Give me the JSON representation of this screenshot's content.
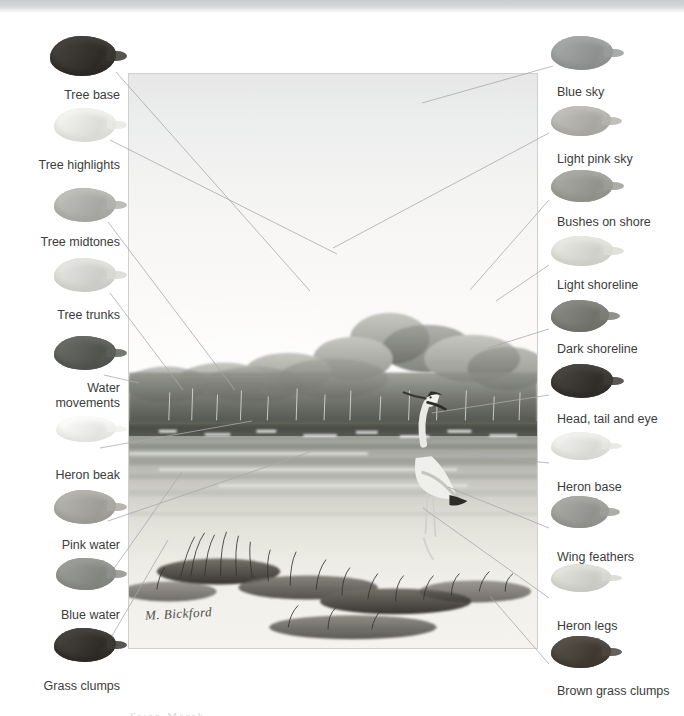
{
  "page": {
    "kind": "painting-color-key-plate",
    "background_color": "#ffffff",
    "top_bar_color": "#d0d2d4"
  },
  "plate": {
    "name": "heron-marsh-painting",
    "signature": "M. Bickford",
    "border_color": "#cfcfcf",
    "bottom_caption_fragment": "Swan Marsh"
  },
  "left_column": {
    "align": "right",
    "items": [
      {
        "label": "Tree base",
        "swatch_color": "#3a3733",
        "swatch_name": "swatch-tree-base"
      },
      {
        "label": "Tree highlights",
        "swatch_color": "#e7e7e4",
        "swatch_name": "swatch-tree-highlights"
      },
      {
        "label": "Tree midtones",
        "swatch_color": "#b2b3ae",
        "swatch_name": "swatch-tree-midtones"
      },
      {
        "label": "Tree trunks",
        "swatch_color": "#d8d9d4",
        "swatch_name": "swatch-tree-trunks"
      },
      {
        "label": "Water\nmovements",
        "swatch_color": "#5d5f5b",
        "swatch_name": "swatch-water-movements"
      },
      {
        "label": "Heron beak",
        "swatch_color": "#f0f0ee",
        "swatch_name": "swatch-heron-beak"
      },
      {
        "label": "Pink water",
        "swatch_color": "#a9a8a2",
        "swatch_name": "swatch-pink-water"
      },
      {
        "label": "Blue water",
        "swatch_color": "#8f918c",
        "swatch_name": "swatch-blue-water"
      },
      {
        "label": "Grass clumps",
        "swatch_color": "#3b3834",
        "swatch_name": "swatch-grass-clumps"
      }
    ]
  },
  "right_column": {
    "align": "left",
    "items": [
      {
        "label": "Blue sky",
        "swatch_color": "#9a9c9b",
        "swatch_name": "swatch-blue-sky"
      },
      {
        "label": "Light pink sky",
        "swatch_color": "#b4b3ae",
        "swatch_name": "swatch-light-pink-sky"
      },
      {
        "label": "Bushes on shore",
        "swatch_color": "#9d9e98",
        "swatch_name": "swatch-bushes-on-shore"
      },
      {
        "label": "Light shoreline",
        "swatch_color": "#dcdcd6",
        "swatch_name": "swatch-light-shoreline"
      },
      {
        "label": "Dark shoreline",
        "swatch_color": "#7d7e77",
        "swatch_name": "swatch-dark-shoreline"
      },
      {
        "label": "Head, tail and eye",
        "swatch_color": "#3d3a36",
        "swatch_name": "swatch-head-tail-eye"
      },
      {
        "label": "Heron base",
        "swatch_color": "#e5e5e1",
        "swatch_name": "swatch-heron-base"
      },
      {
        "label": "Wing feathers",
        "swatch_color": "#9d9e99",
        "swatch_name": "swatch-wing-feathers"
      },
      {
        "label": "Heron legs",
        "swatch_color": "#d7d7d1",
        "swatch_name": "swatch-heron-legs"
      },
      {
        "label": "Brown grass clumps",
        "swatch_color": "#4c453e",
        "swatch_name": "swatch-brown-grass-clumps"
      }
    ]
  },
  "leader_lines": {
    "color": "#a9a9a9",
    "left": [
      {
        "from": [
          116,
          72
        ],
        "to": [
          310,
          291
        ]
      },
      {
        "from": [
          110,
          140
        ],
        "to": [
          337,
          254
        ]
      },
      {
        "from": [
          108,
          222
        ],
        "to": [
          235,
          390
        ]
      },
      {
        "from": [
          110,
          293
        ],
        "to": [
          183,
          390
        ]
      },
      {
        "from": [
          104,
          375
        ],
        "to": [
          139,
          383
        ]
      },
      {
        "from": [
          100,
          448
        ],
        "to": [
          252,
          421
        ]
      },
      {
        "from": [
          108,
          521
        ],
        "to": [
          310,
          452
        ]
      },
      {
        "from": [
          108,
          577
        ],
        "to": [
          182,
          472
        ]
      },
      {
        "from": [
          106,
          646
        ],
        "to": [
          168,
          540
        ]
      }
    ],
    "right": [
      {
        "from": [
          553,
          66
        ],
        "to": [
          422,
          103
        ]
      },
      {
        "from": [
          549,
          133
        ],
        "to": [
          333,
          248
        ]
      },
      {
        "from": [
          549,
          200
        ],
        "to": [
          470,
          290
        ]
      },
      {
        "from": [
          549,
          265
        ],
        "to": [
          496,
          301
        ]
      },
      {
        "from": [
          549,
          329
        ],
        "to": [
          488,
          348
        ]
      },
      {
        "from": [
          549,
          395
        ],
        "to": [
          432,
          413
        ]
      },
      {
        "from": [
          549,
          463
        ],
        "to": [
          428,
          451
        ]
      },
      {
        "from": [
          549,
          528
        ],
        "to": [
          448,
          487
        ]
      },
      {
        "from": [
          549,
          598
        ],
        "to": [
          423,
          508
        ]
      },
      {
        "from": [
          549,
          664
        ],
        "to": [
          490,
          596
        ]
      }
    ]
  }
}
